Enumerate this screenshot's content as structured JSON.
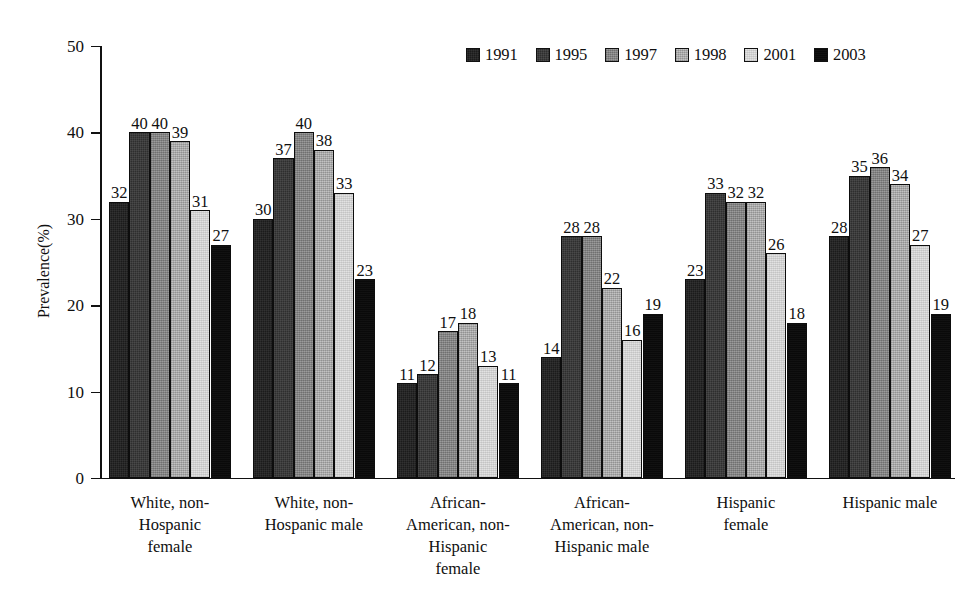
{
  "chart_data": {
    "type": "bar",
    "title": "",
    "subtitle": "",
    "xlabel": "",
    "ylabel": "Prevalence(%)",
    "ylim": [
      0,
      50
    ],
    "yticks": [
      0,
      10,
      20,
      30,
      40,
      50
    ],
    "grid": false,
    "legend_position": "top-right",
    "categories": [
      "White, non-Hospanic female",
      "White, non-Hospanic male",
      "African-American, non-Hispanic female",
      "African-American, non-Hispanic male",
      "Hispanic female",
      "Hispanic male"
    ],
    "category_label_lines": [
      [
        "White, non-",
        "Hospanic",
        "female"
      ],
      [
        "White, non-",
        "Hospanic male"
      ],
      [
        "African-",
        "American, non-",
        "Hispanic",
        "female"
      ],
      [
        "African-",
        "American, non-",
        "Hispanic male"
      ],
      [
        "Hispanic",
        "female"
      ],
      [
        "Hispanic male"
      ]
    ],
    "series": [
      {
        "name": "1991",
        "color": "#1b1b1b",
        "values": [
          32,
          30,
          11,
          14,
          23,
          28
        ]
      },
      {
        "name": "1995",
        "color": "#2e2e2e",
        "values": [
          40,
          37,
          12,
          28,
          33,
          35
        ]
      },
      {
        "name": "1997",
        "color": "#878787",
        "values": [
          40,
          40,
          17,
          28,
          32,
          36
        ]
      },
      {
        "name": "1998",
        "color": "#b4b4b4",
        "values": [
          39,
          38,
          18,
          22,
          32,
          34
        ]
      },
      {
        "name": "2001",
        "color": "#dedede",
        "values": [
          31,
          33,
          13,
          16,
          26,
          27
        ]
      },
      {
        "name": "2003",
        "color": "#0a0a0a",
        "values": [
          27,
          23,
          11,
          19,
          18,
          19
        ]
      }
    ]
  }
}
